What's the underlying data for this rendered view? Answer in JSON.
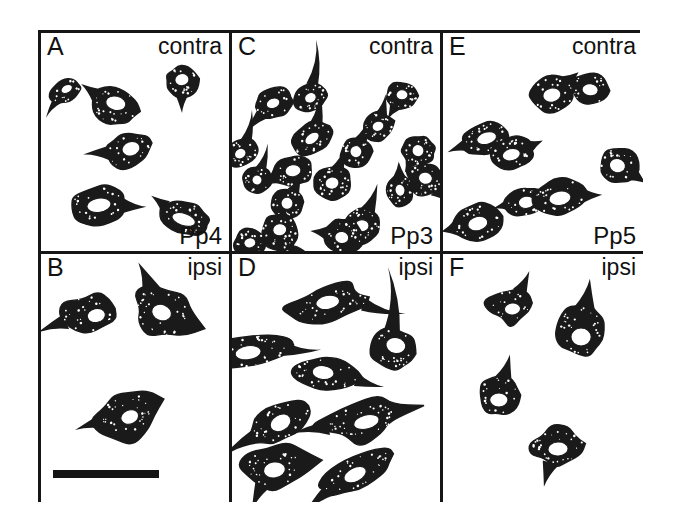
{
  "figure": {
    "panel_layout": "2 rows x 3 columns",
    "ink_color": "#161616",
    "background_color": "#ffffff",
    "cell_fill_color": "#1a1a1a",
    "nucleus_color": "#ffffff"
  },
  "scale_bar": {
    "name": "scale-bar",
    "panel": "B",
    "length_px": 106,
    "thickness_px": 8,
    "label": ""
  },
  "panels": [
    {
      "letter": "A",
      "side": "contra",
      "area": "Pp4",
      "cell_count": 6,
      "cell_shape": "round-to-pear shaped somata with short tapering process",
      "cells": [
        {
          "cx": 24,
          "cy": 57,
          "rx": 16,
          "ry": 11,
          "rot": -28,
          "nx": 2,
          "ny": -1,
          "nrx": 6,
          "nry": 4,
          "tail": 18,
          "tailAngle": 150
        },
        {
          "cx": 72,
          "cy": 72,
          "rx": 24,
          "ry": 18,
          "rot": 12,
          "nx": 1,
          "ny": -3,
          "nrx": 10,
          "nry": 7,
          "tail": 16,
          "tailAngle": 205
        },
        {
          "cx": 139,
          "cy": 48,
          "rx": 16,
          "ry": 15,
          "rot": -10,
          "nx": 0,
          "ny": -2,
          "nrx": 7,
          "nry": 6,
          "tail": 16,
          "tailAngle": 100
        },
        {
          "cx": 86,
          "cy": 116,
          "rx": 23,
          "ry": 17,
          "rot": -18,
          "nx": 3,
          "ny": -1,
          "nrx": 9,
          "nry": 7,
          "tail": 22,
          "tailAngle": 195
        },
        {
          "cx": 56,
          "cy": 170,
          "rx": 28,
          "ry": 19,
          "rot": -8,
          "nx": 1,
          "ny": 0,
          "nrx": 12,
          "nry": 7,
          "tail": 20,
          "tailAngle": 12
        },
        {
          "cx": 141,
          "cy": 182,
          "rx": 26,
          "ry": 16,
          "rot": 18,
          "nx": 0,
          "ny": 2,
          "nrx": 12,
          "nry": 6,
          "tail": 14,
          "tailAngle": 200
        }
      ]
    },
    {
      "letter": "B",
      "side": "ipsi",
      "area": "Pp4",
      "cell_count": 3,
      "cell_shape": "angular multipolar somata with pointed processes",
      "cells": [
        {
          "cx": 47,
          "cy": 60,
          "rx": 28,
          "ry": 19,
          "rot": -12,
          "nx": 7,
          "ny": 3,
          "nrx": 9,
          "nry": 7,
          "tail": 26,
          "tailAngle": 170,
          "spiky": true
        },
        {
          "cx": 120,
          "cy": 58,
          "rx": 30,
          "ry": 24,
          "rot": 22,
          "nx": -1,
          "ny": 1,
          "nrx": 10,
          "nry": 8,
          "tail": 28,
          "tailAngle": 225,
          "spiky": true
        },
        {
          "cx": 84,
          "cy": 160,
          "rx": 27,
          "ry": 20,
          "rot": -22,
          "nx": 2,
          "ny": 4,
          "nrx": 9,
          "nry": 7,
          "tail": 26,
          "tailAngle": 185,
          "spiky": true
        }
      ]
    },
    {
      "letter": "C",
      "side": "contra",
      "area": "Pp3",
      "cell_count": 19,
      "cell_shape": "densely packed pear-shaped somata with long apical tapering processes",
      "cells": [
        {
          "cx": 42,
          "cy": 69,
          "rx": 20,
          "ry": 15,
          "rot": -20,
          "nx": -1,
          "ny": 0,
          "nrx": 7,
          "nry": 5,
          "tail": 24,
          "tailAngle": 150
        },
        {
          "cx": 78,
          "cy": 63,
          "rx": 17,
          "ry": 14,
          "rot": -25,
          "nx": 0,
          "ny": 1,
          "nrx": 6,
          "nry": 5,
          "tail": 42,
          "tailAngle": 300
        },
        {
          "cx": 170,
          "cy": 62,
          "rx": 16,
          "ry": 14,
          "rot": 0,
          "nx": 0,
          "ny": -1,
          "nrx": 6,
          "nry": 5,
          "tail": 12,
          "tailAngle": 120
        },
        {
          "cx": 10,
          "cy": 118,
          "rx": 18,
          "ry": 13,
          "rot": -30,
          "nx": -2,
          "ny": 0,
          "nrx": 6,
          "nry": 5,
          "tail": 28,
          "tailAngle": 310
        },
        {
          "cx": 80,
          "cy": 104,
          "rx": 22,
          "ry": 15,
          "rot": -35,
          "nx": 0,
          "ny": 0,
          "nrx": 8,
          "nry": 5,
          "tail": 30,
          "tailAngle": 310
        },
        {
          "cx": 124,
          "cy": 118,
          "rx": 16,
          "ry": 15,
          "rot": -5,
          "nx": 0,
          "ny": -1,
          "nrx": 6,
          "nry": 6,
          "tail": 20,
          "tailAngle": 295
        },
        {
          "cx": 186,
          "cy": 116,
          "rx": 17,
          "ry": 15,
          "rot": 10,
          "nx": 0,
          "ny": 0,
          "nrx": 6,
          "nry": 6,
          "tail": 10,
          "tailAngle": 110
        },
        {
          "cx": 25,
          "cy": 145,
          "rx": 15,
          "ry": 13,
          "rot": -20,
          "nx": 0,
          "ny": 0,
          "nrx": 5,
          "nry": 5,
          "tail": 24,
          "tailAngle": 305
        },
        {
          "cx": 60,
          "cy": 136,
          "rx": 21,
          "ry": 15,
          "rot": -8,
          "nx": 1,
          "ny": 0,
          "nrx": 8,
          "nry": 6,
          "tail": 18,
          "tailAngle": 160
        },
        {
          "cx": 100,
          "cy": 148,
          "rx": 19,
          "ry": 16,
          "rot": -12,
          "nx": 0,
          "ny": 0,
          "nrx": 7,
          "nry": 6,
          "tail": 20,
          "tailAngle": 300
        },
        {
          "cx": 55,
          "cy": 168,
          "rx": 17,
          "ry": 15,
          "rot": -5,
          "nx": 0,
          "ny": 0,
          "nrx": 6,
          "nry": 6,
          "tail": 16,
          "tailAngle": 300
        },
        {
          "cx": 168,
          "cy": 155,
          "rx": 14,
          "ry": 16,
          "rot": -12,
          "nx": 0,
          "ny": 0,
          "nrx": 5,
          "nry": 6,
          "tail": 12,
          "tailAngle": 280
        },
        {
          "cx": 192,
          "cy": 145,
          "rx": 18,
          "ry": 17,
          "rot": 12,
          "nx": 1,
          "ny": -2,
          "nrx": 7,
          "nry": 6,
          "tail": 14,
          "tailAngle": 30,
          "spiky": true
        },
        {
          "cx": 48,
          "cy": 196,
          "rx": 19,
          "ry": 18,
          "rot": -8,
          "nx": 0,
          "ny": -2,
          "nrx": 7,
          "nry": 6,
          "tail": 22,
          "tailAngle": 70
        },
        {
          "cx": 130,
          "cy": 190,
          "rx": 19,
          "ry": 18,
          "rot": 0,
          "nx": 0,
          "ny": 0,
          "nrx": 7,
          "nry": 6,
          "tail": 26,
          "tailAngle": 290
        },
        {
          "cx": 112,
          "cy": 200,
          "rx": 20,
          "ry": 17,
          "rot": 8,
          "nx": -2,
          "ny": 2,
          "nrx": 7,
          "nry": 6,
          "tail": 14,
          "tailAngle": 180
        },
        {
          "cx": 18,
          "cy": 208,
          "rx": 16,
          "ry": 15,
          "rot": -10,
          "nx": 0,
          "ny": -1,
          "nrx": 6,
          "nry": 5,
          "tail": 16,
          "tailAngle": 110
        },
        {
          "cx": 62,
          "cy": 228,
          "rx": 15,
          "ry": 17,
          "rot": 5,
          "nx": 0,
          "ny": -1,
          "nrx": 5,
          "nry": 6,
          "tail": 12,
          "tailAngle": 80
        },
        {
          "cx": 146,
          "cy": 92,
          "rx": 16,
          "ry": 14,
          "rot": -18,
          "nx": 0,
          "ny": 0,
          "nrx": 6,
          "nry": 5,
          "tail": 18,
          "tailAngle": 300
        }
      ]
    },
    {
      "letter": "D",
      "side": "ipsi",
      "area": "Pp3",
      "cell_count": 8,
      "cell_shape": "elongated fusiform and multipolar somata with long thin processes",
      "cells": [
        {
          "cx": 98,
          "cy": 50,
          "rx": 42,
          "ry": 16,
          "rot": -10,
          "nx": -2,
          "ny": -2,
          "nrx": 12,
          "nry": 7,
          "tail": 38,
          "tailAngle": 25,
          "spiky": true
        },
        {
          "cx": 14,
          "cy": 98,
          "rx": 46,
          "ry": 16,
          "rot": -8,
          "nx": 2,
          "ny": 1,
          "nrx": 13,
          "nry": 7,
          "tail": 30,
          "tailAngle": 10
        },
        {
          "cx": 161,
          "cy": 95,
          "rx": 23,
          "ry": 20,
          "rot": 12,
          "nx": 2,
          "ny": -4,
          "nrx": 10,
          "nry": 8,
          "tail": 62,
          "tailAngle": 255
        },
        {
          "cx": 95,
          "cy": 120,
          "rx": 35,
          "ry": 16,
          "rot": 6,
          "nx": -4,
          "ny": -1,
          "nrx": 11,
          "nry": 7,
          "tail": 24,
          "tailAngle": 10
        },
        {
          "cx": 48,
          "cy": 168,
          "rx": 34,
          "ry": 18,
          "rot": -30,
          "nx": 0,
          "ny": 1,
          "nrx": 11,
          "nry": 8,
          "tail": 34,
          "tailAngle": 178
        },
        {
          "cx": 130,
          "cy": 167,
          "rx": 40,
          "ry": 17,
          "rot": -14,
          "nx": 4,
          "ny": 2,
          "nrx": 13,
          "nry": 7,
          "tail": 34,
          "tailAngle": 185,
          "spiky": true
        },
        {
          "cx": 42,
          "cy": 213,
          "rx": 30,
          "ry": 20,
          "rot": -8,
          "nx": 0,
          "ny": 3,
          "nrx": 11,
          "nry": 8,
          "tail": 26,
          "tailAngle": 120,
          "spiky": true
        },
        {
          "cx": 124,
          "cy": 218,
          "rx": 40,
          "ry": 16,
          "rot": -26,
          "nx": -2,
          "ny": 2,
          "nrx": 12,
          "nry": 7,
          "tail": 30,
          "tailAngle": 160
        }
      ]
    },
    {
      "letter": "E",
      "side": "contra",
      "area": "Pp5",
      "cell_count": 8,
      "cell_shape": "compact oval somata with thick short processes",
      "cells": [
        {
          "cx": 108,
          "cy": 60,
          "rx": 22,
          "ry": 19,
          "rot": -12,
          "nx": -1,
          "ny": 1,
          "nrx": 9,
          "nry": 7,
          "tail": 12,
          "tailAngle": 330
        },
        {
          "cx": 145,
          "cy": 55,
          "rx": 19,
          "ry": 16,
          "rot": 6,
          "nx": 0,
          "ny": 1,
          "nrx": 8,
          "nry": 6,
          "tail": 10,
          "tailAngle": 200
        },
        {
          "cx": 42,
          "cy": 104,
          "rx": 24,
          "ry": 15,
          "rot": -16,
          "nx": 1,
          "ny": 0,
          "nrx": 10,
          "nry": 6,
          "tail": 16,
          "tailAngle": 175
        },
        {
          "cx": 67,
          "cy": 119,
          "rx": 22,
          "ry": 16,
          "rot": -14,
          "nx": 0,
          "ny": 1,
          "nrx": 9,
          "nry": 6,
          "tail": 12,
          "tailAngle": 350
        },
        {
          "cx": 173,
          "cy": 130,
          "rx": 19,
          "ry": 18,
          "rot": 14,
          "nx": -1,
          "ny": 1,
          "nrx": 8,
          "nry": 7,
          "tail": 14,
          "tailAngle": 20
        },
        {
          "cx": 82,
          "cy": 166,
          "rx": 21,
          "ry": 14,
          "rot": -8,
          "nx": 0,
          "ny": 1,
          "nrx": 8,
          "nry": 6,
          "tail": 12,
          "tailAngle": 175
        },
        {
          "cx": 115,
          "cy": 162,
          "rx": 26,
          "ry": 18,
          "rot": -10,
          "nx": 0,
          "ny": 1,
          "nrx": 11,
          "nry": 7,
          "tail": 16,
          "tailAngle": 8
        },
        {
          "cx": 34,
          "cy": 187,
          "rx": 25,
          "ry": 19,
          "rot": -14,
          "nx": 0,
          "ny": 1,
          "nrx": 10,
          "nry": 7,
          "tail": 12,
          "tailAngle": 180
        }
      ]
    },
    {
      "letter": "F",
      "side": "ipsi",
      "area": "Pp5",
      "cell_count": 4,
      "cell_shape": "sparse angular and teardrop shaped somata",
      "cells": [
        {
          "cx": 68,
          "cy": 51,
          "rx": 21,
          "ry": 17,
          "rot": -6,
          "nx": 0,
          "ny": 4,
          "nrx": 8,
          "nry": 6,
          "tail": 20,
          "tailAngle": 300,
          "spiky": true
        },
        {
          "cx": 136,
          "cy": 76,
          "rx": 24,
          "ry": 26,
          "rot": 0,
          "nx": 0,
          "ny": 7,
          "nrx": 10,
          "nry": 9,
          "tail": 26,
          "tailAngle": 280
        },
        {
          "cx": 55,
          "cy": 141,
          "rx": 20,
          "ry": 20,
          "rot": 0,
          "nx": 0,
          "ny": 5,
          "nrx": 9,
          "nry": 7,
          "tail": 22,
          "tailAngle": 285
        },
        {
          "cx": 113,
          "cy": 192,
          "rx": 28,
          "ry": 20,
          "rot": -5,
          "nx": 0,
          "ny": 3,
          "nrx": 10,
          "nry": 7,
          "tail": 22,
          "tailAngle": 110,
          "spiky": true
        }
      ]
    }
  ]
}
